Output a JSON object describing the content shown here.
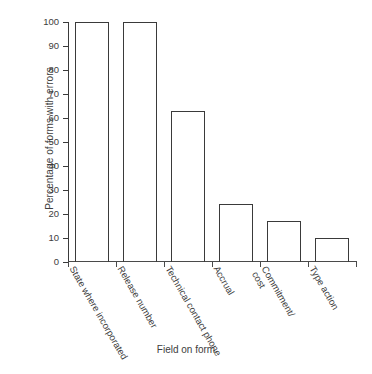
{
  "chart_data": {
    "type": "bar",
    "title": "",
    "xlabel": "Field on form",
    "ylabel": "Percentage of forms with errors",
    "categories": [
      "State where incorporated",
      "Release number",
      "Technical contact phone",
      "Accrual",
      "Commitment/ cost",
      "Type action"
    ],
    "values": [
      100,
      100,
      63,
      24,
      17,
      10
    ],
    "ylim": [
      0,
      100
    ],
    "ytick_labels": [
      "0",
      "10",
      "20",
      "30",
      "40",
      "50",
      "60",
      "70",
      "80",
      "90",
      "100"
    ],
    "ytick_values": [
      0,
      10,
      20,
      30,
      40,
      50,
      60,
      70,
      80,
      90,
      100
    ],
    "grid": false,
    "legend": false,
    "bar_style": "outline",
    "bar_edge_color": "#3a3a3a",
    "bar_fill_color": "#ffffff",
    "axis_color": "#3a3a3a",
    "background_color": "#ffffff"
  }
}
